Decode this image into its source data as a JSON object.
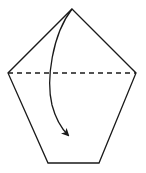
{
  "diagram": {
    "type": "origami-instruction",
    "colors": {
      "stroke": "#1a1a1a",
      "fill": "#ffffff",
      "background": "#ffffff"
    },
    "shape": {
      "name": "pentagon",
      "vertices": [
        [
          72,
          9
        ],
        [
          136,
          73
        ],
        [
          99,
          163
        ],
        [
          48,
          163
        ],
        [
          8,
          73
        ]
      ]
    },
    "fold_line": {
      "style": "dashed",
      "meaning": "valley-fold",
      "from": [
        8,
        73
      ],
      "to": [
        136,
        73
      ]
    },
    "arrow": {
      "meaning": "fold-direction",
      "from": [
        72,
        9
      ],
      "to": [
        69,
        136
      ]
    }
  }
}
